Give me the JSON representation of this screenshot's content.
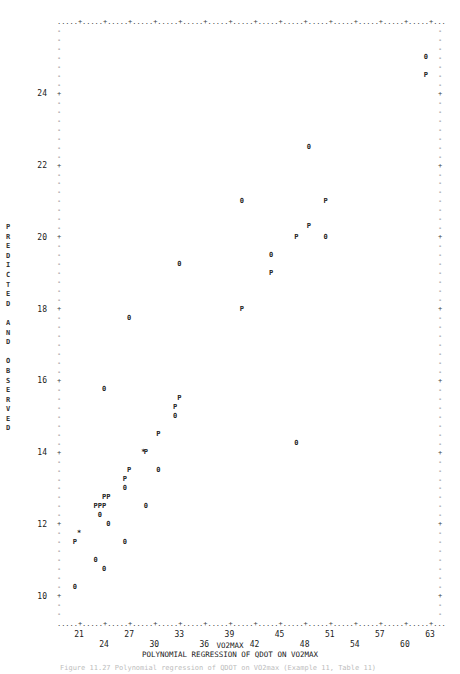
{
  "chart_data": {
    "type": "scatter",
    "title": "POLYNOMIAL REGRESSION OF QDOT ON VO2MAX",
    "xlabel": "VO2MAX",
    "ylabel": "PREDICTED AND OBSERVED",
    "xlim": [
      18.5,
      64
    ],
    "ylim": [
      9.2,
      26.2
    ],
    "x_ticks_upper": [
      "21",
      "27",
      "33",
      "39",
      "45",
      "51",
      "57",
      "63"
    ],
    "x_ticks_lower": [
      "24",
      "30",
      "36",
      "42",
      "48",
      "54",
      "60"
    ],
    "y_ticks": [
      "10",
      "12",
      "14",
      "16",
      "18",
      "20",
      "22",
      "24"
    ],
    "legend": {
      "O": "Observed",
      "P": "Predicted",
      "*": "Observed and predicted coincide"
    },
    "grid": false,
    "series": [
      {
        "name": "Observed (O)",
        "symbol": "O",
        "points": [
          [
            62.5,
            25.0
          ],
          [
            48.5,
            22.5
          ],
          [
            40.5,
            21.0
          ],
          [
            50.5,
            20.0
          ],
          [
            44.0,
            19.5
          ],
          [
            33.0,
            19.25
          ],
          [
            27.0,
            17.75
          ],
          [
            24.0,
            15.75
          ],
          [
            32.5,
            15.0
          ],
          [
            47.0,
            14.25
          ],
          [
            30.5,
            13.5
          ],
          [
            26.5,
            13.0
          ],
          [
            29.0,
            12.5
          ],
          [
            23.5,
            12.25
          ],
          [
            24.5,
            12.0
          ],
          [
            26.5,
            11.5
          ],
          [
            23.0,
            11.0
          ],
          [
            24.0,
            10.75
          ],
          [
            20.5,
            10.25
          ]
        ]
      },
      {
        "name": "Predicted (P)",
        "symbol": "P",
        "points": [
          [
            62.5,
            24.5
          ],
          [
            50.5,
            21.0
          ],
          [
            47.0,
            20.0
          ],
          [
            48.5,
            20.3
          ],
          [
            44.0,
            19.0
          ],
          [
            40.5,
            18.0
          ],
          [
            33.0,
            15.5
          ],
          [
            32.5,
            15.25
          ],
          [
            30.5,
            14.5
          ],
          [
            29.0,
            14.0
          ],
          [
            27.0,
            13.5
          ],
          [
            26.5,
            13.25
          ],
          [
            24.0,
            12.75
          ],
          [
            24.5,
            12.75
          ],
          [
            23.0,
            12.5
          ],
          [
            23.5,
            12.5
          ],
          [
            24.0,
            12.5
          ],
          [
            20.5,
            11.5
          ]
        ]
      },
      {
        "name": "Coincident (*)",
        "symbol": "*",
        "points": [
          [
            28.7,
            14.0
          ],
          [
            21.0,
            11.75
          ]
        ]
      }
    ]
  },
  "labels": {
    "ylabel_letters": "P\nR\nE\nD\nI\nC\nT\nE\nD\n \nA\nN\nD\n \nO\nB\nS\nE\nR\nV\nE\nD",
    "xlabel": "VO2MAX",
    "title": "POLYNOMIAL REGRESSION OF QDOT ON VO2MAX",
    "caption": "Figure 11.27  Polynomial regression of QDOT on VO2max (Example 11, Table 11)"
  }
}
